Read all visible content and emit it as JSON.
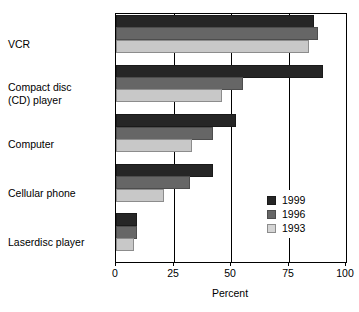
{
  "chart_data": {
    "type": "bar",
    "orientation": "horizontal",
    "title": "",
    "subtitle": "",
    "xlabel": "Percent",
    "ylabel": "",
    "xlim": [
      0,
      100
    ],
    "xticks": [
      0,
      25,
      50,
      75,
      100
    ],
    "xtick_labels": [
      "0",
      "25",
      "50",
      "75",
      "100"
    ],
    "grid": true,
    "grid_axis": "x",
    "legend_position": "lower-right-inside",
    "categories": [
      "VCR",
      "Compact disc\n(CD) player",
      "Computer",
      "Cellular phone",
      "Laserdisc player"
    ],
    "category_labels_plain": [
      "VCR",
      "Compact disc (CD) player",
      "Computer",
      "Cellular phone",
      "Laserdisc player"
    ],
    "series": [
      {
        "name": "1999",
        "color": "#262626",
        "values": [
          86,
          90,
          52,
          42,
          9
        ]
      },
      {
        "name": "1996",
        "color": "#666666",
        "values": [
          88,
          55,
          42,
          32,
          9
        ]
      },
      {
        "name": "1993",
        "color": "#c8c8c8",
        "values": [
          84,
          46,
          33,
          21,
          8
        ]
      }
    ]
  },
  "legend": {
    "entries": [
      {
        "label": "1999",
        "swatch": "swatch-1999"
      },
      {
        "label": "1996",
        "swatch": "swatch-1996"
      },
      {
        "label": "1993",
        "swatch": "swatch-1993"
      }
    ]
  },
  "axis": {
    "x_label": "Percent",
    "x_tick_0": "0",
    "x_tick_1": "25",
    "x_tick_2": "50",
    "x_tick_3": "75",
    "x_tick_4": "100"
  },
  "categories": {
    "c0": "VCR",
    "c1": "Compact disc\n(CD) player",
    "c2": "Computer",
    "c3": "Cellular phone",
    "c4": "Laserdisc player"
  }
}
